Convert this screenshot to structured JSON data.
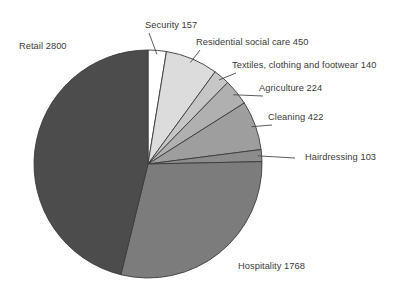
{
  "chart_data": {
    "type": "pie",
    "title": "",
    "subtitle": "",
    "xlabel": "",
    "ylabel": "",
    "legend_position": "none",
    "grid": false,
    "total": 6064,
    "units": "cases",
    "start_angle_deg": 0,
    "direction": "clockwise",
    "categories": [
      "Security",
      "Residential social care",
      "Textiles, clothing and footwear",
      "Agriculture",
      "Cleaning",
      "Hairdressing",
      "Hospitality",
      "Retail"
    ],
    "values": [
      157,
      450,
      140,
      224,
      422,
      103,
      1768,
      2800
    ],
    "slices": [
      {
        "name": "Security",
        "value": 157,
        "label": "Security 157",
        "color": "#ffffff",
        "percent": 2.6,
        "angle_deg": 9.32,
        "start_deg": 0.0,
        "end_deg": 9.32,
        "label_x": 145,
        "label_y": 20,
        "leader": "down-left"
      },
      {
        "name": "Residential social care",
        "value": 450,
        "label": "Residential social care 450",
        "color": "#dcdcdc",
        "percent": 7.4,
        "angle_deg": 26.72,
        "start_deg": 9.32,
        "end_deg": 36.04,
        "label_x": 196,
        "label_y": 37,
        "leader": "down-left"
      },
      {
        "name": "Textiles, clothing and footwear",
        "value": 140,
        "label": "Textiles, clothing and footwear 140",
        "color": "#c6c6c6",
        "percent": 2.3,
        "angle_deg": 8.31,
        "start_deg": 36.04,
        "end_deg": 44.35,
        "label_x": 232,
        "label_y": 60,
        "leader": "down-left"
      },
      {
        "name": "Agriculture",
        "value": 224,
        "label": "Agriculture 224",
        "color": "#b0b0b0",
        "percent": 3.7,
        "angle_deg": 13.3,
        "start_deg": 44.35,
        "end_deg": 57.65,
        "label_x": 259,
        "label_y": 83,
        "leader": "down-left"
      },
      {
        "name": "Cleaning",
        "value": 422,
        "label": "Cleaning 422",
        "color": "#9e9e9e",
        "percent": 7.0,
        "angle_deg": 25.05,
        "start_deg": 57.65,
        "end_deg": 82.7,
        "label_x": 268,
        "label_y": 112,
        "leader": "down-left"
      },
      {
        "name": "Hairdressing",
        "value": 103,
        "label": "Hairdressing 103",
        "color": "#8c8c8c",
        "percent": 1.7,
        "angle_deg": 6.11,
        "start_deg": 82.7,
        "end_deg": 88.81,
        "label_x": 305,
        "label_y": 152,
        "leader": "left"
      },
      {
        "name": "Hospitality",
        "value": 1768,
        "label": "Hospitality 1768",
        "color": "#7c7c7c",
        "percent": 29.2,
        "angle_deg": 104.96,
        "start_deg": 88.81,
        "end_deg": 193.77,
        "label_x": 238,
        "label_y": 261,
        "leader": "none"
      },
      {
        "name": "Retail",
        "value": 2800,
        "label": "Retail 2800",
        "color": "#4c4c4c",
        "percent": 46.2,
        "angle_deg": 166.23,
        "start_deg": 193.77,
        "end_deg": 360.0,
        "label_x": 19,
        "label_y": 41,
        "leader": "none"
      }
    ],
    "geometry": {
      "center_x": 148,
      "center_y": 164,
      "radius": 114
    },
    "colors": {
      "outline": "#3b3b3b",
      "text": "#3a3a3a",
      "leader": "#4a4a4a",
      "background": "#ffffff"
    }
  }
}
